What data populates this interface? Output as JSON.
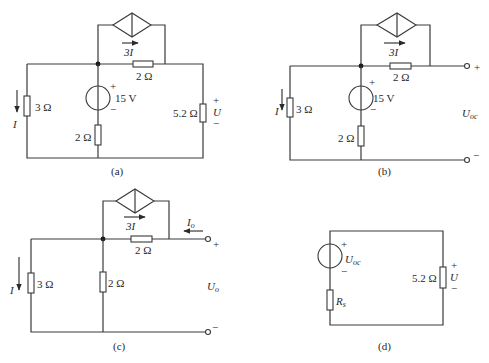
{
  "figures": {
    "a": {
      "caption": "(a)",
      "dep_source": "3I",
      "r_top": "2 Ω",
      "r_left": "3 Ω",
      "current_label": "I",
      "vsource": "15 V",
      "vs_plus": "+",
      "vs_minus": "−",
      "r_mid": "2 Ω",
      "r_load": "5.2 Ω",
      "out_plus": "+",
      "out_label": "U",
      "out_minus": "−"
    },
    "b": {
      "caption": "(b)",
      "dep_source": "3I",
      "r_top": "2 Ω",
      "r_left": "3 Ω",
      "current_label": "I",
      "vsource": "15 V",
      "vs_plus": "+",
      "vs_minus": "−",
      "r_mid": "2 Ω",
      "term_plus": "+",
      "term_minus": "−",
      "out_label_main": "U",
      "out_label_sub": "oc"
    },
    "c": {
      "caption": "(c)",
      "dep_source": "3I",
      "r_top": "2 Ω",
      "r_left": "3 Ω",
      "current_label": "I",
      "r_mid": "2 Ω",
      "io_main": "I",
      "io_sub": "o",
      "term_plus": "+",
      "term_minus": "−",
      "out_label_main": "U",
      "out_label_sub": "o"
    },
    "d": {
      "caption": "(d)",
      "src_main": "U",
      "src_sub": "oc",
      "vs_plus": "+",
      "vs_minus": "−",
      "rs_main": "R",
      "rs_sub": "s",
      "r_load": "5.2 Ω",
      "out_plus": "+",
      "out_label": "U",
      "out_minus": "−"
    }
  }
}
